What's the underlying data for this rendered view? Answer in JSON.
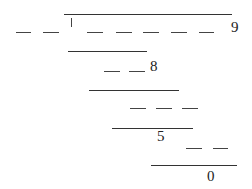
{
  "diagram": {
    "colors": {
      "line": "#333333",
      "text": "#222222",
      "background": "#ffffff"
    },
    "solid_lines": [
      {
        "x1": 64,
        "x2": 232,
        "y": 14
      },
      {
        "x1": 68,
        "x2": 147,
        "y": 51
      },
      {
        "x1": 89,
        "x2": 179,
        "y": 90
      },
      {
        "x1": 112,
        "x2": 193,
        "y": 128
      },
      {
        "x1": 151,
        "x2": 237,
        "y": 165
      }
    ],
    "dashed_rows": [
      {
        "y": 32,
        "segments": [
          [
            16,
            31
          ],
          [
            43,
            59
          ],
          [
            87,
            103
          ],
          [
            116,
            132
          ],
          [
            143,
            159
          ],
          [
            171,
            187
          ],
          [
            199,
            214
          ]
        ]
      },
      {
        "y": 71,
        "segments": [
          [
            104,
            120
          ],
          [
            129,
            145
          ]
        ]
      },
      {
        "y": 108,
        "segments": [
          [
            130,
            146
          ],
          [
            156,
            172
          ],
          [
            182,
            198
          ]
        ]
      },
      {
        "y": 148,
        "segments": [
          [
            186,
            202
          ],
          [
            213,
            228
          ]
        ]
      }
    ],
    "labels": [
      {
        "text": "1",
        "x": 68,
        "y": 17
      },
      {
        "text": "9",
        "x": 231,
        "y": 20
      },
      {
        "text": "8",
        "x": 150,
        "y": 59
      },
      {
        "text": "5",
        "x": 157,
        "y": 129
      },
      {
        "text": "0",
        "x": 207,
        "y": 169
      }
    ]
  }
}
